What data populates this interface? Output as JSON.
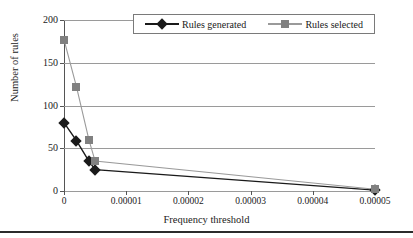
{
  "chart_data": {
    "type": "line",
    "title": "",
    "xlabel": "Frequency threshold",
    "ylabel": "Number of rules",
    "xlim": [
      0,
      5e-05
    ],
    "ylim": [
      0,
      200
    ],
    "xticks": [
      "0",
      "0.00001",
      "0.00002",
      "0.00003",
      "0.00004",
      "0.00005"
    ],
    "xtick_values": [
      0,
      1e-05,
      2e-05,
      3e-05,
      4e-05,
      5e-05
    ],
    "yticks": [
      "0",
      "50",
      "100",
      "150",
      "200"
    ],
    "ytick_values": [
      0,
      50,
      100,
      150,
      200
    ],
    "grid": "horizontal",
    "legend_position": "top-center",
    "x": [
      0,
      2e-06,
      4e-06,
      5e-06,
      5e-05
    ],
    "series": [
      {
        "name": "Rules generated",
        "marker": "diamond",
        "color": "#1a1a1a",
        "values": [
          80,
          59,
          35,
          25,
          1
        ]
      },
      {
        "name": "Rules selected",
        "marker": "square",
        "color": "#808080",
        "values": [
          177,
          122,
          60,
          35,
          2
        ]
      }
    ]
  },
  "legend": {
    "entries": [
      {
        "label": "Rules generated"
      },
      {
        "label": "Rules selected"
      }
    ]
  },
  "axes": {
    "x_title": "Frequency threshold",
    "y_title": "Number of rules"
  },
  "colors": {
    "series_generated": "#1a1a1a",
    "series_selected": "#808080",
    "gridline": "#9a9a9a",
    "axis": "#555555",
    "background": "#ffffff",
    "rule": "#2b2b2b"
  }
}
